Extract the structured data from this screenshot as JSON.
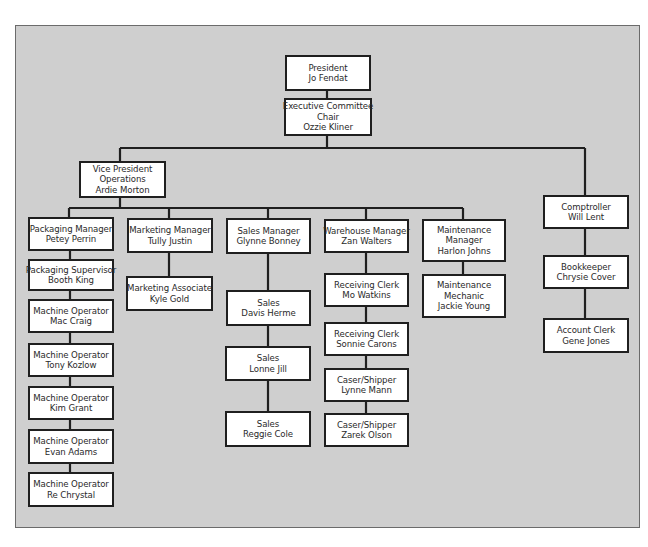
{
  "diagram": {
    "type": "org-chart",
    "colors": {
      "panel_background": "#cfcfcf",
      "box_background": "#ffffff",
      "line": "#1f1f1f"
    },
    "nodes": {
      "president": {
        "title": "President",
        "name": "Jo Fendat"
      },
      "exec_chair": {
        "title1": "Executive Committee",
        "title2": "Chair",
        "name": "Ozzie Kliner"
      },
      "vp_operations": {
        "title1": "Vice President",
        "title2": "Operations",
        "name": "Ardie Morton"
      },
      "comptroller": {
        "title": "Comptroller",
        "name": "Will Lent"
      },
      "bookkeeper": {
        "title": "Bookkeeper",
        "name": "Chrysie Cover"
      },
      "account_clerk": {
        "title": "Account Clerk",
        "name": "Gene Jones"
      },
      "packaging_manager": {
        "title": "Packaging Manager",
        "name": "Petey Perrin"
      },
      "packaging_supervisor": {
        "title": "Packaging Supervisor",
        "name": "Booth King"
      },
      "machine_operators": [
        {
          "title": "Machine Operator",
          "name": "Mac Craig"
        },
        {
          "title": "Machine Operator",
          "name": "Tony Kozlow"
        },
        {
          "title": "Machine Operator",
          "name": "Kim Grant"
        },
        {
          "title": "Machine Operator",
          "name": "Evan Adams"
        },
        {
          "title": "Machine Operator",
          "name": "Re Chrystal"
        }
      ],
      "marketing_manager": {
        "title": "Marketing Manager",
        "name": "Tully Justin"
      },
      "marketing_associate": {
        "title": "Marketing Associate",
        "name": "Kyle Gold"
      },
      "sales_manager": {
        "title": "Sales Manager",
        "name": "Glynne Bonney"
      },
      "sales": [
        {
          "title": "Sales",
          "name": "Davis Herme"
        },
        {
          "title": "Sales",
          "name": "Lonne Jill"
        },
        {
          "title": "Sales",
          "name": "Reggie Cole"
        }
      ],
      "warehouse_manager": {
        "title": "Warehouse Manager",
        "name": "Zan Walters"
      },
      "warehouse_staff": [
        {
          "title": "Receiving Clerk",
          "name": "Mo Watkins"
        },
        {
          "title": "Receiving Clerk",
          "name": "Sonnie Carons"
        },
        {
          "title": "Caser/Shipper",
          "name": "Lynne Mann"
        },
        {
          "title": "Caser/Shipper",
          "name": "Zarek Olson"
        }
      ],
      "maintenance_manager": {
        "title1": "Maintenance",
        "title2": "Manager",
        "name": "Harlon Johns"
      },
      "maintenance_mechanic": {
        "title1": "Maintenance",
        "title2": "Mechanic",
        "name": "Jackie Young"
      }
    }
  }
}
